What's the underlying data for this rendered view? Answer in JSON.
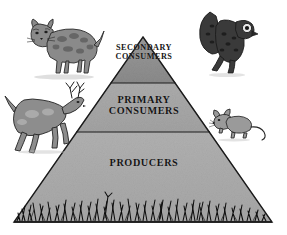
{
  "diagram": {
    "type": "trophic-pyramid",
    "background_color": "#ffffff",
    "outline_color": "#1a1a1a",
    "tiers": [
      {
        "id": "secondary-consumers",
        "label": "SECONDARY\nCONSUMERS",
        "level": 3,
        "position": "top",
        "fill_color": "#8f8f8f"
      },
      {
        "id": "primary-consumers",
        "label": "PRIMARY\nCONSUMERS",
        "level": 2,
        "position": "middle",
        "fill_color": "#a5a5a5"
      },
      {
        "id": "producers",
        "label": "PRODUCERS",
        "level": 1,
        "position": "bottom",
        "fill_color": "#ababab"
      }
    ],
    "organisms": [
      {
        "id": "bobcat",
        "name": "bobcat",
        "icon": "bobcat-icon",
        "tier": "secondary-consumers",
        "side": "left"
      },
      {
        "id": "owl",
        "name": "owl",
        "icon": "owl-icon",
        "tier": "secondary-consumers",
        "side": "right"
      },
      {
        "id": "deer",
        "name": "deer",
        "icon": "deer-icon",
        "tier": "primary-consumers",
        "side": "left"
      },
      {
        "id": "mouse",
        "name": "mouse",
        "icon": "mouse-icon",
        "tier": "primary-consumers",
        "side": "right"
      }
    ],
    "base_vegetation": {
      "id": "grass",
      "name": "grass",
      "icon": "grass-icon",
      "color": "#111111"
    }
  }
}
